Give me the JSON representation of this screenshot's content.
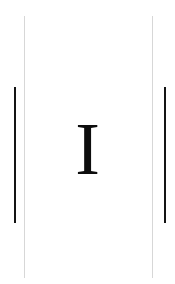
{
  "page": {
    "width": 175,
    "height": 284,
    "background_color": "#ffffff"
  },
  "glyph": {
    "character": "I",
    "color": "#0d0d0d",
    "style": "serif-capital"
  },
  "rules": {
    "thin_color": "#d7d7d7",
    "thick_color": "#141414",
    "items": [
      {
        "name": "thin-left",
        "label": "I"
      },
      {
        "name": "thin-right",
        "label": "I"
      },
      {
        "name": "thick-left",
        "label": "I"
      },
      {
        "name": "thick-right",
        "label": "I"
      }
    ]
  }
}
